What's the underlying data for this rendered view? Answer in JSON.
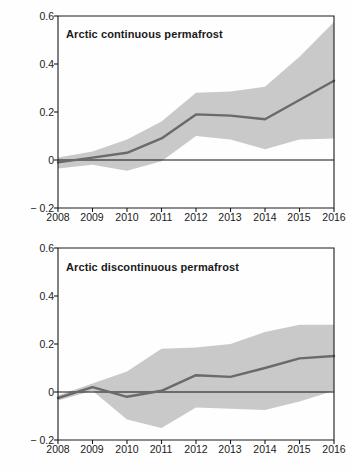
{
  "figure": {
    "axis_label_y": "Temperature variation  (°C)",
    "panels": [
      {
        "title": "Arctic continuous permafrost",
        "yticks": [
          "0.6",
          "0.4",
          "0.2",
          "0",
          "− 0.2"
        ],
        "xticks": [
          "2008",
          "2009",
          "2010",
          "2011",
          "2012",
          "2013",
          "2014",
          "2015",
          "2016"
        ]
      },
      {
        "title": "Arctic discontinuous permafrost",
        "yticks": [
          "0.6",
          "0.4",
          "0.2",
          "0",
          "− 0.2"
        ],
        "xticks": [
          "2008",
          "2009",
          "2010",
          "2011",
          "2012",
          "2013",
          "2014",
          "2015",
          "2016"
        ]
      }
    ]
  },
  "colors": {
    "band": "#c9c9c9",
    "line": "#6a6a6a",
    "axis": "#1a1a1a",
    "zero_line": "#111111",
    "background": "#ffffff"
  },
  "chart_data": [
    {
      "type": "area",
      "title": "Arctic continuous permafrost",
      "xlabel": "",
      "ylabel": "Temperature variation (°C)",
      "x": [
        2008,
        2009,
        2010,
        2011,
        2012,
        2013,
        2014,
        2015,
        2016
      ],
      "xlim": [
        2008,
        2016
      ],
      "ylim": [
        -0.2,
        0.6
      ],
      "ytick_values": [
        0.6,
        0.4,
        0.2,
        0.0,
        -0.2
      ],
      "grid": false,
      "legend": "none",
      "zero_reference_line": 0,
      "series": [
        {
          "name": "mean temperature variation",
          "role": "line",
          "values": [
            -0.01,
            0.01,
            0.03,
            0.09,
            0.19,
            0.185,
            0.17,
            0.25,
            0.33
          ]
        },
        {
          "name": "uncertainty band upper",
          "role": "band_upper",
          "values": [
            0.01,
            0.035,
            0.085,
            0.16,
            0.28,
            0.285,
            0.305,
            0.43,
            0.575
          ]
        },
        {
          "name": "uncertainty band lower",
          "role": "band_lower",
          "values": [
            -0.035,
            -0.02,
            -0.045,
            -0.005,
            0.1,
            0.085,
            0.045,
            0.085,
            0.09
          ]
        }
      ]
    },
    {
      "type": "area",
      "title": "Arctic discontinuous permafrost",
      "xlabel": "",
      "ylabel": "Temperature variation (°C)",
      "x": [
        2008,
        2009,
        2010,
        2011,
        2012,
        2013,
        2014,
        2015,
        2016
      ],
      "xlim": [
        2008,
        2016
      ],
      "ylim": [
        -0.2,
        0.6
      ],
      "ytick_values": [
        0.6,
        0.4,
        0.2,
        0.0,
        -0.2
      ],
      "grid": false,
      "legend": "none",
      "zero_reference_line": 0,
      "series": [
        {
          "name": "mean temperature variation",
          "role": "line",
          "values": [
            -0.025,
            0.02,
            -0.02,
            0.005,
            0.07,
            0.063,
            0.1,
            0.14,
            0.15
          ]
        },
        {
          "name": "uncertainty band upper",
          "role": "band_upper",
          "values": [
            -0.015,
            0.035,
            0.085,
            0.18,
            0.185,
            0.2,
            0.25,
            0.28,
            0.28
          ]
        },
        {
          "name": "uncertainty band lower",
          "role": "band_lower",
          "values": [
            -0.035,
            0.005,
            -0.115,
            -0.15,
            -0.065,
            -0.07,
            -0.075,
            -0.04,
            0.005
          ]
        }
      ]
    }
  ]
}
